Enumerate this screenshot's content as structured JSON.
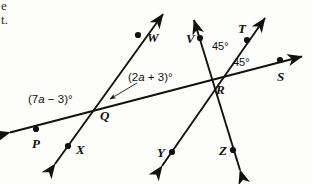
{
  "figure": {
    "kind": "geometry-diagram",
    "background_color": "#fdfdfc",
    "ink_color": "#111111",
    "width": 312,
    "height": 184
  },
  "clipped_text": {
    "line_1": "e",
    "line_2": "t."
  },
  "points": [
    {
      "id": "W",
      "label": "W",
      "x": 138,
      "y": 35,
      "label_x": 147,
      "label_y": 31
    },
    {
      "id": "V",
      "label": "V",
      "x": 200,
      "y": 38,
      "label_x": 186,
      "label_y": 32
    },
    {
      "id": "T",
      "label": "T",
      "x": 247,
      "y": 40,
      "label_x": 238,
      "label_y": 22
    },
    {
      "id": "S",
      "label": "S",
      "x": 280,
      "y": 60,
      "label_x": 277,
      "label_y": 70
    },
    {
      "id": "Q",
      "label": "Q",
      "x": 102,
      "y": 103,
      "label_x": 100,
      "label_y": 109
    },
    {
      "id": "R",
      "label": "R",
      "x": 213,
      "y": 77,
      "label_x": 216,
      "label_y": 83
    },
    {
      "id": "P",
      "label": "P",
      "x": 36,
      "y": 129,
      "label_x": 32,
      "label_y": 137
    },
    {
      "id": "X",
      "label": "X",
      "x": 68,
      "y": 146,
      "label_x": 76,
      "label_y": 143
    },
    {
      "id": "Y",
      "label": "Y",
      "x": 172,
      "y": 152,
      "label_x": 157,
      "label_y": 146
    },
    {
      "id": "Z",
      "label": "Z",
      "x": 233,
      "y": 150,
      "label_x": 219,
      "label_y": 144
    }
  ],
  "angles": [
    {
      "id": "angle-at-q-left",
      "text": "(7a − 3)°",
      "pre": "(7",
      "var": "a",
      "post": " − 3)°",
      "vertex": "Q",
      "label_x": 28,
      "label_y": 94
    },
    {
      "id": "angle-at-q-right",
      "text": "(2a + 3)°",
      "pre": "(2",
      "var": "a",
      "post": " + 3)°",
      "vertex": "Q",
      "label_x": 128,
      "label_y": 72,
      "has_leader": true
    },
    {
      "id": "angle-at-r-upper",
      "text": "45°",
      "vertex": "R",
      "label_x": 212,
      "label_y": 41
    },
    {
      "id": "angle-at-r-lower",
      "text": "45°",
      "vertex": "R",
      "label_x": 233,
      "label_y": 57
    }
  ],
  "lines": [
    {
      "id": "line-p-s",
      "name": "transversal-p-q-r-s",
      "from": [
        4,
        134
      ],
      "to": [
        308,
        54
      ],
      "arrow_start": true,
      "arrow_end": true
    },
    {
      "id": "line-x-w",
      "name": "line-through-q",
      "from": [
        50,
        170
      ],
      "to": [
        168,
        8
      ],
      "arrow_start": true,
      "arrow_end": true
    },
    {
      "id": "line-y-t",
      "name": "line-through-r-to-t",
      "from": [
        157,
        172
      ],
      "to": [
        270,
        12
      ],
      "arrow_start": true,
      "arrow_end": true
    },
    {
      "id": "line-z-v",
      "name": "line-through-r-to-v",
      "from": [
        242,
        176
      ],
      "to": [
        193,
        14
      ],
      "arrow_start": true,
      "arrow_end": true
    }
  ]
}
